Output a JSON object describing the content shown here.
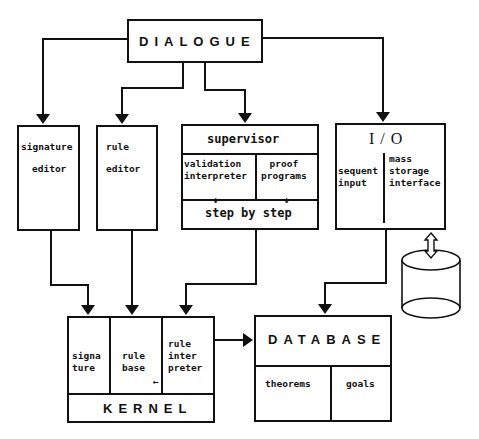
{
  "diagram": {
    "dialogue": {
      "label": "DIALOGUE"
    },
    "signature_editor": {
      "line1": "signature",
      "line2": "editor"
    },
    "rule_editor": {
      "line1": "rule",
      "line2": "editor"
    },
    "supervisor": {
      "title": "supervisor",
      "validation": "validation\ninterpreter",
      "proof": "proof\nprograms",
      "step": "step by step",
      "small_arrow": "↓"
    },
    "io": {
      "title": "I / O",
      "sequent": "sequent\ninput",
      "mass": "mass\nstorage\ninterface"
    },
    "kernel": {
      "title": "KERNEL",
      "signature": "signa\nture",
      "rule_base": "rule\nbase",
      "rule_interpreter": "rule\ninter\npreter",
      "small_arrow": "←"
    },
    "database": {
      "title": "DATABASE",
      "theorems": "theorems",
      "goals": "goals"
    },
    "storage": {
      "icon": "disk-cylinder"
    },
    "edges": [
      {
        "from": "DIALOGUE",
        "to": "signature editor"
      },
      {
        "from": "DIALOGUE",
        "to": "rule editor"
      },
      {
        "from": "DIALOGUE",
        "to": "supervisor"
      },
      {
        "from": "DIALOGUE",
        "to": "I/O"
      },
      {
        "from": "signature editor",
        "to": "KERNEL.signature"
      },
      {
        "from": "rule editor",
        "to": "KERNEL.rule base"
      },
      {
        "from": "supervisor",
        "to": "KERNEL.rule interpreter"
      },
      {
        "from": "I/O",
        "to": "DATABASE"
      },
      {
        "from": "KERNEL",
        "to": "DATABASE"
      },
      {
        "from": "I/O",
        "to": "storage",
        "bidirectional": true
      }
    ]
  }
}
